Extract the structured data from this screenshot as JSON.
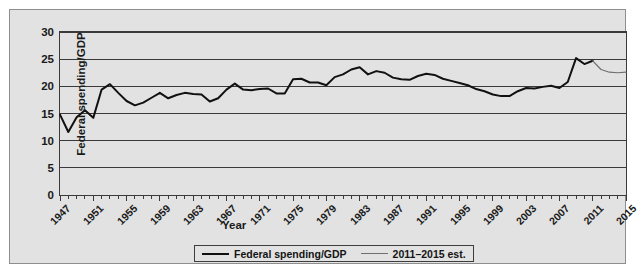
{
  "figure": {
    "top_bleed_fragment": "· · · · · ·",
    "background_color": "#e2e2e2",
    "frame_color": "#8e8e8e"
  },
  "axes": {
    "y_title": "Federal spending/GDP",
    "x_title": "Year",
    "y_ticks": [
      "0",
      "5",
      "10",
      "15",
      "20",
      "25",
      "30"
    ],
    "x_ticks": [
      "1947",
      "1951",
      "1955",
      "1959",
      "1963",
      "1967",
      "1971",
      "1975",
      "1979",
      "1983",
      "1987",
      "1991",
      "1995",
      "1999",
      "2003",
      "2007",
      "2011",
      "2015"
    ]
  },
  "legend": {
    "items": [
      {
        "label": "Federal spending/GDP",
        "swatch": "series-main",
        "color": "#111111"
      },
      {
        "label": "2011–2015 est.",
        "swatch": "series-est",
        "color": "#6f6f6f"
      }
    ]
  },
  "chart_data": {
    "type": "line",
    "title": "",
    "xlabel": "Year",
    "ylabel": "Federal spending/GDP",
    "xlim": [
      1947,
      2015
    ],
    "ylim": [
      0,
      30
    ],
    "yticks": [
      0,
      5,
      10,
      15,
      20,
      25,
      30
    ],
    "xtick_step": 4,
    "minor_xtick_step": 1,
    "grid": "horizontal",
    "legend_position": "below-center",
    "x": [
      1947,
      1948,
      1949,
      1950,
      1951,
      1952,
      1953,
      1954,
      1955,
      1956,
      1957,
      1958,
      1959,
      1960,
      1961,
      1962,
      1963,
      1964,
      1965,
      1966,
      1967,
      1968,
      1969,
      1970,
      1971,
      1972,
      1973,
      1974,
      1975,
      1976,
      1977,
      1978,
      1979,
      1980,
      1981,
      1982,
      1983,
      1984,
      1985,
      1986,
      1987,
      1988,
      1989,
      1990,
      1991,
      1992,
      1993,
      1994,
      1995,
      1996,
      1997,
      1998,
      1999,
      2000,
      2001,
      2002,
      2003,
      2004,
      2005,
      2006,
      2007,
      2008,
      2009,
      2010,
      2011,
      2012,
      2013,
      2014,
      2015
    ],
    "series": [
      {
        "name": "Federal spending/GDP",
        "color": "#111111",
        "width": 2.0,
        "values": [
          14.8,
          11.6,
          14.3,
          15.6,
          14.2,
          19.4,
          20.4,
          18.8,
          17.3,
          16.5,
          17.0,
          17.9,
          18.8,
          17.8,
          18.4,
          18.8,
          18.6,
          18.5,
          17.2,
          17.8,
          19.4,
          20.5,
          19.4,
          19.3,
          19.5,
          19.6,
          18.7,
          18.7,
          21.3,
          21.4,
          20.7,
          20.7,
          20.2,
          21.7,
          22.2,
          23.1,
          23.5,
          22.2,
          22.8,
          22.5,
          21.6,
          21.3,
          21.2,
          21.9,
          22.3,
          22.1,
          21.4,
          21.0,
          20.6,
          20.2,
          19.5,
          19.1,
          18.5,
          18.2,
          18.2,
          19.1,
          19.7,
          19.6,
          19.9,
          20.1,
          19.7,
          20.8,
          25.2,
          24.1,
          24.7,
          null,
          null,
          null,
          null
        ]
      },
      {
        "name": "2011–2015 est.",
        "color": "#6f6f6f",
        "width": 1.2,
        "values": [
          null,
          null,
          null,
          null,
          null,
          null,
          null,
          null,
          null,
          null,
          null,
          null,
          null,
          null,
          null,
          null,
          null,
          null,
          null,
          null,
          null,
          null,
          null,
          null,
          null,
          null,
          null,
          null,
          null,
          null,
          null,
          null,
          null,
          null,
          null,
          null,
          null,
          null,
          null,
          null,
          null,
          null,
          null,
          null,
          null,
          null,
          null,
          null,
          null,
          null,
          null,
          null,
          null,
          null,
          null,
          null,
          null,
          null,
          null,
          null,
          null,
          null,
          null,
          null,
          24.7,
          23.1,
          22.6,
          22.5,
          22.6
        ]
      }
    ]
  }
}
